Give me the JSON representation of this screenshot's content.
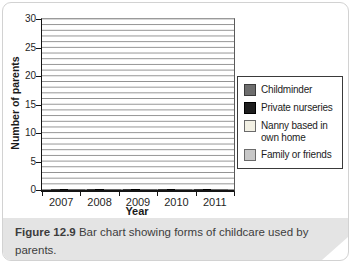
{
  "figure": {
    "caption_label": "Figure 12.9",
    "caption_text": "Bar chart showing forms of childcare used by parents.",
    "background_color": "#ffffff",
    "caption_background": "#e4e4e4",
    "card_border_color": "#d2d2d2"
  },
  "chart_data": {
    "type": "bar",
    "title": "",
    "xlabel": "Year",
    "ylabel": "Number of parents",
    "ylim": [
      0,
      30
    ],
    "ytick_step": 5,
    "minor_grid_step": 1,
    "grid": "horizontal-minor-every-1-unit",
    "grid_color": "#909090",
    "legend_position": "right",
    "categories": [
      "2007",
      "2008",
      "2009",
      "2010",
      "2011"
    ],
    "series": [
      {
        "name": "Childminder",
        "color": "#6d6d6d",
        "border": "#3a3a3a",
        "values": [
          20,
          22,
          24,
          25,
          25
        ]
      },
      {
        "name": "Private nurseries",
        "color": "#1e1e1e",
        "border": "#000000",
        "values": [
          18,
          21,
          24,
          26,
          28
        ]
      },
      {
        "name": "Nanny based in own home",
        "color": "#f2f0e4",
        "border": "#6a6a6a",
        "values": [
          10,
          10,
          8,
          7,
          7
        ],
        "grid_shows_through": true
      },
      {
        "name": "Family or friends",
        "color": "#c7c7c7",
        "border": "#6a6a6a",
        "values": [
          6,
          6,
          6,
          5,
          5
        ],
        "grid_shows_through": true
      }
    ]
  }
}
